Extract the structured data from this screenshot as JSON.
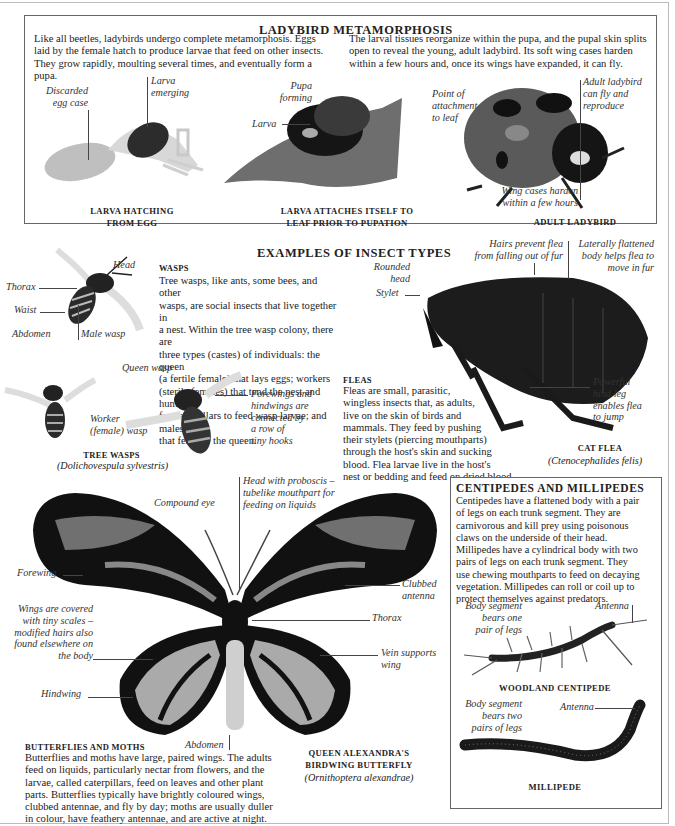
{
  "ladybird": {
    "title": "LADYBIRD METAMORPHOSIS",
    "intro_left": [
      "Like all beetles, ladybirds undergo complete metamorphosis. Eggs",
      "laid by the female hatch to produce larvae that feed on other insects.",
      "They grow rapidly, moulting several times, and eventually form a pupa."
    ],
    "intro_right": [
      "The larval tissues reorganize within the pupa, and the pupal skin splits",
      "open to reveal the young, adult ladybird. Its soft wing cases harden",
      "within a few hours and, once its wings have expanded, it can fly."
    ],
    "labels": {
      "discarded_egg_case": [
        "Discarded",
        "egg case"
      ],
      "larva_emerging": [
        "Larva",
        "emerging"
      ],
      "pupa_forming": [
        "Pupa",
        "forming"
      ],
      "larva": "Larva",
      "point_of_attachment": [
        "Point of",
        "attachment",
        "to leaf"
      ],
      "adult_ladybird": [
        "Adult ladybird",
        "can fly and",
        "reproduce"
      ],
      "wing_cases": [
        "Wing cases harden",
        "within a few hours"
      ]
    },
    "captions": {
      "hatching": [
        "LARVA HATCHING",
        "FROM EGG"
      ],
      "attaches": [
        "LARVA ATTACHES ITSELF TO",
        "LEAF PRIOR TO PUPATION"
      ],
      "adult": "ADULT  LADYBIRD"
    }
  },
  "insect_types": {
    "title": "EXAMPLES OF INSECT TYPES",
    "wasps": {
      "heading": "WASPS",
      "text": [
        "Tree wasps, like ants, some bees, and other",
        "wasps, are social insects that live together in",
        "a nest. Within the tree wasp colony, there are",
        "three types (castes) of individuals: the queen",
        "(a fertile female) that lays eggs; workers",
        "(sterile females) that tend the nest and hunt",
        "for caterpillars to feed wasp larvae; and males",
        "that fertilize the queen."
      ],
      "labels": {
        "head": "Head",
        "thorax": "Thorax",
        "waist": "Waist",
        "abdomen": "Abdomen",
        "male_wasp": "Male wasp",
        "queen_wasp": "Queen wasp",
        "worker": [
          "Worker",
          "(female) wasp"
        ],
        "forewings": [
          "Forewings and",
          "hindwings are",
          "connected by",
          "a row of",
          "tiny hooks"
        ]
      },
      "caption": "TREE WASPS",
      "scientific": "(Dolichovespula sylvestris)"
    },
    "fleas": {
      "heading": "FLEAS",
      "text": [
        "Fleas are small, parasitic,",
        "wingless insects that, as adults,",
        "live on the skin of birds and",
        "mammals. They feed by pushing",
        "their stylets (piercing mouthparts)",
        "through the host's skin and sucking",
        "blood. Flea larvae live in the host's",
        "nest or bedding and feed on dried blood."
      ],
      "labels": {
        "hairs": [
          "Hairs prevent flea",
          "from falling out of fur"
        ],
        "laterally": [
          "Laterally flattened",
          "body helps flea to",
          "move in fur"
        ],
        "rounded_head": [
          "Rounded",
          "head"
        ],
        "stylet": "Stylet",
        "hind_leg": [
          "Powerful",
          "hind leg",
          "enables flea",
          "to jump"
        ]
      },
      "caption": "CAT FLEA",
      "scientific": "(Ctenocephalides felis)"
    }
  },
  "butterflies": {
    "heading": "BUTTERFLIES AND MOTHS",
    "text": [
      "Butterflies and moths have large, paired wings. The adults",
      "feed on liquids, particularly nectar from flowers, and the",
      "larvae, called caterpillars, feed on leaves and other plant",
      "parts. Butterflies typically have brightly coloured wings,",
      "clubbed antennae, and fly by day; moths are usually duller",
      "in colour, have feathery antennae, and are active at night."
    ],
    "labels": {
      "head_proboscis": [
        "Head with proboscis –",
        "tubelike mouthpart for",
        "feeding on liquids"
      ],
      "compound_eye": "Compound eye",
      "forewing": "Forewing",
      "clubbed_antenna": [
        "Clubbed",
        "antenna"
      ],
      "scales": [
        "Wings are covered",
        "with tiny scales –",
        "modified hairs also",
        "found elsewhere on",
        "the body"
      ],
      "thorax": "Thorax",
      "vein": [
        "Vein supports",
        "wing"
      ],
      "hindwing": "Hindwing",
      "abdomen": "Abdomen"
    },
    "caption": [
      "QUEEN ALEXANDRA'S",
      "BIRDWING BUTTERFLY"
    ],
    "scientific": "(Ornithoptera alexandrae)"
  },
  "centipedes": {
    "heading": "CENTIPEDES AND MILLIPEDES",
    "text": [
      "Centipedes have a flattened body with a pair",
      "of legs on each trunk segment. They are",
      "carnivorous and kill prey using poisonous",
      "claws on the underside of their head.",
      "Millipedes have a cylindrical body with two",
      "pairs of legs on each trunk segment. They",
      "use chewing mouthparts to feed on decaying",
      "vegetation. Millipedes can roll or coil up to",
      "protect themselves against predators."
    ],
    "labels": {
      "body_one": [
        "Body segment",
        "bears one",
        "pair of legs"
      ],
      "antenna1": "Antenna",
      "body_two": [
        "Body segment",
        "bears two",
        "pairs of legs"
      ],
      "antenna2": "Antenna"
    },
    "caption_centipede": "WOODLAND CENTIPEDE",
    "caption_millipede": "MILLIPEDE"
  }
}
